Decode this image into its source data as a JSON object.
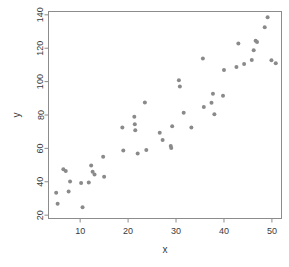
{
  "chart_data": {
    "type": "scatter",
    "title": "",
    "xlabel": "x",
    "ylabel": "y",
    "grid": false,
    "legend": null,
    "xlim": [
      3.4,
      52.0
    ],
    "ylim": [
      18.0,
      142.0
    ],
    "xticks": [
      10,
      20,
      30,
      40,
      50
    ],
    "yticks": [
      20,
      40,
      60,
      80,
      100,
      120,
      140
    ],
    "xtick_labels": [
      "10",
      "20",
      "30",
      "40",
      "50"
    ],
    "ytick_labels": [
      "20",
      "40",
      "60",
      "80",
      "100",
      "120",
      "140"
    ],
    "marker": {
      "shape": "circle",
      "size": 2.0,
      "color": "#8a8a8a"
    },
    "points": [
      {
        "x": 5.0,
        "y": 33.5
      },
      {
        "x": 5.3,
        "y": 26.8
      },
      {
        "x": 6.5,
        "y": 47.5
      },
      {
        "x": 7.0,
        "y": 46.5
      },
      {
        "x": 7.6,
        "y": 34.2
      },
      {
        "x": 7.9,
        "y": 40.2
      },
      {
        "x": 10.2,
        "y": 39.2
      },
      {
        "x": 10.5,
        "y": 24.8
      },
      {
        "x": 11.8,
        "y": 39.5
      },
      {
        "x": 12.3,
        "y": 49.8
      },
      {
        "x": 12.6,
        "y": 46.0
      },
      {
        "x": 13.0,
        "y": 44.3
      },
      {
        "x": 14.8,
        "y": 55.0
      },
      {
        "x": 15.0,
        "y": 43.0
      },
      {
        "x": 18.8,
        "y": 72.5
      },
      {
        "x": 19.0,
        "y": 58.8
      },
      {
        "x": 21.3,
        "y": 79.0
      },
      {
        "x": 21.4,
        "y": 74.5
      },
      {
        "x": 21.5,
        "y": 70.8
      },
      {
        "x": 22.0,
        "y": 57.0
      },
      {
        "x": 23.5,
        "y": 87.5
      },
      {
        "x": 23.8,
        "y": 59.0
      },
      {
        "x": 26.6,
        "y": 69.3
      },
      {
        "x": 27.2,
        "y": 65.0
      },
      {
        "x": 28.9,
        "y": 61.5
      },
      {
        "x": 29.0,
        "y": 60.3
      },
      {
        "x": 29.2,
        "y": 73.2
      },
      {
        "x": 30.6,
        "y": 100.8
      },
      {
        "x": 30.8,
        "y": 97.0
      },
      {
        "x": 31.6,
        "y": 81.3
      },
      {
        "x": 33.2,
        "y": 72.5
      },
      {
        "x": 35.6,
        "y": 113.8
      },
      {
        "x": 35.8,
        "y": 84.8
      },
      {
        "x": 37.4,
        "y": 87.3
      },
      {
        "x": 37.7,
        "y": 92.8
      },
      {
        "x": 38.0,
        "y": 80.5
      },
      {
        "x": 39.8,
        "y": 91.5
      },
      {
        "x": 40.0,
        "y": 107.0
      },
      {
        "x": 42.6,
        "y": 108.8
      },
      {
        "x": 43.0,
        "y": 122.8
      },
      {
        "x": 44.2,
        "y": 110.5
      },
      {
        "x": 45.8,
        "y": 113.0
      },
      {
        "x": 46.2,
        "y": 118.8
      },
      {
        "x": 46.6,
        "y": 124.5
      },
      {
        "x": 46.9,
        "y": 123.8
      },
      {
        "x": 48.5,
        "y": 132.5
      },
      {
        "x": 49.1,
        "y": 138.5
      },
      {
        "x": 49.9,
        "y": 112.8
      },
      {
        "x": 50.8,
        "y": 111.0
      }
    ]
  },
  "axis": {
    "x_label": "x",
    "y_label": "y",
    "frame_color": "#8c8c8c",
    "tick_color": "#8c8c8c",
    "text_color": "#3a3a3a"
  }
}
